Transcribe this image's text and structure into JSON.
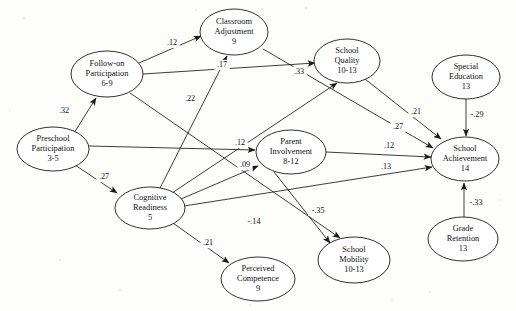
{
  "figure": {
    "type": "path-diagram",
    "title": "",
    "background_color": "#fdfdfc",
    "stroke_color": "#1a1a1a"
  },
  "nodes": [
    {
      "id": "classroom-adjustment",
      "lines": [
        "Classroom",
        "Adjustment",
        "9"
      ],
      "cx": 234,
      "cy": 32,
      "rx": 34,
      "ry": 23
    },
    {
      "id": "follow-on-participation",
      "lines": [
        "Follow-on",
        "Participation",
        "6-9"
      ],
      "cx": 107,
      "cy": 74,
      "rx": 36,
      "ry": 23
    },
    {
      "id": "school-quality",
      "lines": [
        "School",
        "Quality",
        "10-13"
      ],
      "cx": 347,
      "cy": 61,
      "rx": 33,
      "ry": 22
    },
    {
      "id": "special-education",
      "lines": [
        "Special",
        "Education",
        "13"
      ],
      "cx": 466,
      "cy": 77,
      "rx": 34,
      "ry": 22
    },
    {
      "id": "preschool-participation",
      "lines": [
        "Preschool",
        "Participation",
        "3-5"
      ],
      "cx": 53,
      "cy": 149,
      "rx": 36,
      "ry": 22
    },
    {
      "id": "parent-involvement",
      "lines": [
        "Parent",
        "Involvement",
        "8-12"
      ],
      "cx": 291,
      "cy": 152,
      "rx": 35,
      "ry": 22
    },
    {
      "id": "school-achievement",
      "lines": [
        "School",
        "Achievement",
        "14"
      ],
      "cx": 465,
      "cy": 159,
      "rx": 34,
      "ry": 22
    },
    {
      "id": "cognitive-readiness",
      "lines": [
        "Cognitive",
        "Readiness",
        "5"
      ],
      "cx": 150,
      "cy": 208,
      "rx": 35,
      "ry": 21
    },
    {
      "id": "school-mobility",
      "lines": [
        "School",
        "Mobility",
        "10-13"
      ],
      "cx": 354,
      "cy": 260,
      "rx": 36,
      "ry": 23
    },
    {
      "id": "grade-retention",
      "lines": [
        "Grade",
        "Retention",
        "13"
      ],
      "cx": 463,
      "cy": 239,
      "rx": 35,
      "ry": 22
    },
    {
      "id": "perceived-competence",
      "lines": [
        "Perceived",
        "Competence",
        "9"
      ],
      "cx": 258,
      "cy": 279,
      "rx": 37,
      "ry": 22
    }
  ],
  "edges": [
    {
      "id": "preschool-to-followon",
      "from": "preschool-participation",
      "to": "follow-on-participation",
      "coefficient": ".32",
      "label_x": 64,
      "label_y": 111,
      "x1": 74,
      "y1": 133,
      "x2": 96,
      "y2": 98
    },
    {
      "id": "preschool-to-cognitive",
      "from": "preschool-participation",
      "to": "cognitive-readiness",
      "coefficient": ".27",
      "label_x": 104,
      "label_y": 177,
      "x1": 75,
      "y1": 165,
      "x2": 117,
      "y2": 193
    },
    {
      "id": "preschool-to-parent",
      "from": "preschool-participation",
      "to": "parent-involvement",
      "coefficient": ".12",
      "label_x": 240,
      "label_y": 143,
      "x1": 89,
      "y1": 146,
      "x2": 255,
      "y2": 150
    },
    {
      "id": "followon-to-classroom",
      "from": "follow-on-participation",
      "to": "classroom-adjustment",
      "coefficient": ".12",
      "label_x": 172,
      "label_y": 43,
      "x1": 139,
      "y1": 63,
      "x2": 201,
      "y2": 36
    },
    {
      "id": "followon-to-schoolquality",
      "from": "follow-on-participation",
      "to": "school-quality",
      "coefficient": ".17",
      "label_x": 222,
      "label_y": 65,
      "x1": 143,
      "y1": 74,
      "x2": 315,
      "y2": 63
    },
    {
      "id": "followon-to-mobility",
      "from": "follow-on-participation",
      "to": "school-mobility",
      "coefficient": "-.35",
      "label_x": 318,
      "label_y": 211,
      "x1": 130,
      "y1": 93,
      "x2": 340,
      "y2": 238
    },
    {
      "id": "cognitive-to-classroom",
      "from": "cognitive-readiness",
      "to": "classroom-adjustment",
      "coefficient": ".22",
      "label_x": 190,
      "label_y": 99,
      "x1": 160,
      "y1": 188,
      "x2": 227,
      "y2": 56
    },
    {
      "id": "cognitive-to-schoolquality",
      "from": "cognitive-readiness",
      "to": "school-quality",
      "coefficient": ".33",
      "label_x": 299,
      "label_y": 72,
      "x1": 172,
      "y1": 193,
      "x2": 337,
      "y2": 83
    },
    {
      "id": "cognitive-to-parent",
      "from": "cognitive-readiness",
      "to": "parent-involvement",
      "coefficient": ".09",
      "label_x": 245,
      "label_y": 165,
      "x1": 181,
      "y1": 199,
      "x2": 258,
      "y2": 166
    },
    {
      "id": "cognitive-to-achievement",
      "from": "cognitive-readiness",
      "to": "school-achievement",
      "coefficient": ".13",
      "label_x": 386,
      "label_y": 167,
      "x1": 184,
      "y1": 206,
      "x2": 432,
      "y2": 167
    },
    {
      "id": "cognitive-to-perceived",
      "from": "cognitive-readiness",
      "to": "perceived-competence",
      "coefficient": ".21",
      "label_x": 208,
      "label_y": 243,
      "x1": 173,
      "y1": 223,
      "x2": 229,
      "y2": 263
    },
    {
      "id": "parent-to-achievement",
      "from": "parent-involvement",
      "to": "school-achievement",
      "coefficient": ".12",
      "label_x": 389,
      "label_y": 146,
      "x1": 326,
      "y1": 152,
      "x2": 431,
      "y2": 157
    },
    {
      "id": "parent-to-mobility",
      "from": "parent-involvement",
      "to": "school-mobility",
      "coefficient": "-.14",
      "label_x": 254,
      "label_y": 222,
      "x1": 274,
      "y1": 172,
      "x2": 330,
      "y2": 243
    },
    {
      "id": "schoolquality-to-achievement",
      "from": "school-quality",
      "to": "school-achievement",
      "coefficient": ".21",
      "label_x": 416,
      "label_y": 112,
      "x1": 365,
      "y1": 79,
      "x2": 441,
      "y2": 139
    },
    {
      "id": "classroom-to-achievement",
      "from": "classroom-adjustment",
      "to": "school-achievement",
      "coefficient": ".27",
      "label_x": 398,
      "label_y": 127,
      "x1": 263,
      "y1": 49,
      "x2": 433,
      "y2": 148
    },
    {
      "id": "specialed-to-achievement",
      "from": "special-education",
      "to": "school-achievement",
      "coefficient": "-.29",
      "label_x": 477,
      "label_y": 115,
      "x1": 466,
      "y1": 99,
      "x2": 466,
      "y2": 136
    },
    {
      "id": "retention-to-achievement",
      "from": "grade-retention",
      "to": "school-achievement",
      "coefficient": "-.33",
      "label_x": 476,
      "label_y": 203,
      "x1": 464,
      "y1": 217,
      "x2": 464,
      "y2": 183
    }
  ]
}
